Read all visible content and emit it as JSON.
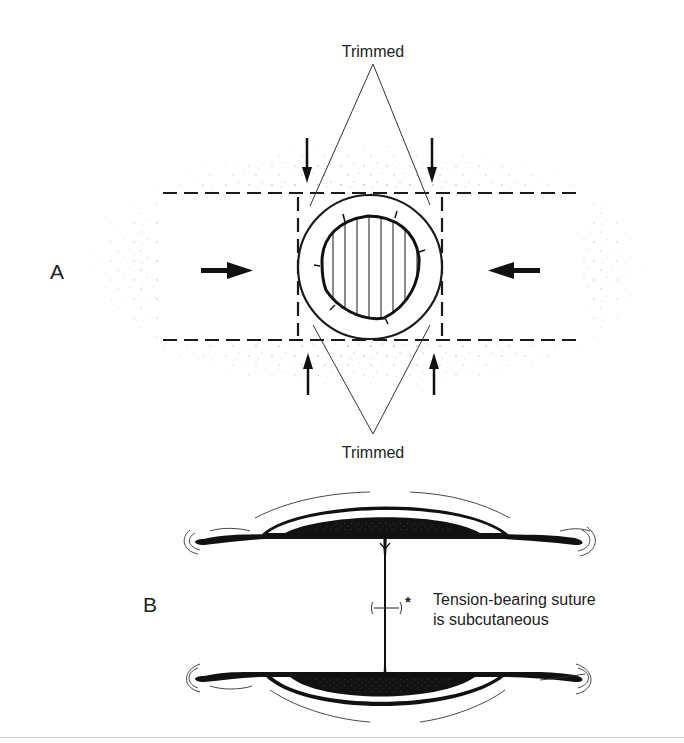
{
  "figure": {
    "panel_a": {
      "label": "A",
      "top_callout": "Trimmed",
      "bottom_callout": "Trimmed",
      "arrows": [
        "right-arrow-left-side",
        "left-arrow-right-side",
        "down-arrow-top-left",
        "down-arrow-top-right",
        "up-arrow-bottom-left",
        "up-arrow-bottom-right"
      ]
    },
    "panel_b": {
      "label": "B",
      "annotation_marker": "*",
      "annotation_line1": "Tension-bearing suture",
      "annotation_line2": "is subcutaneous"
    },
    "colors": {
      "ink": "#1a1a1a",
      "text": "#222222",
      "stipple": "#8a8a8a",
      "background": "#ffffff",
      "rule": "#cfcfcf"
    }
  }
}
